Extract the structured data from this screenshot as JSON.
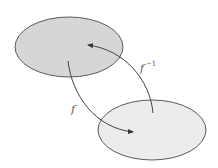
{
  "diagram": {
    "sets": [
      {
        "name": "domain",
        "fill": "#d6d6d6",
        "stroke": "#5a5a5a"
      },
      {
        "name": "codomain",
        "fill": "#ececec",
        "stroke": "#5a5a5a"
      }
    ],
    "arrows": [
      {
        "name": "f",
        "label": "f",
        "from": "domain",
        "to": "codomain"
      },
      {
        "name": "f-inverse",
        "label": "f",
        "superscript": "−1",
        "from": "codomain",
        "to": "domain"
      }
    ]
  }
}
